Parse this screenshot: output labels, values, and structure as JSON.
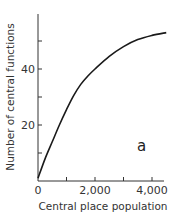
{
  "chart_data": {
    "type": "line",
    "title": "",
    "panel_label": "a",
    "xlabel": "Central place population",
    "ylabel": "Number of central functions",
    "xlim": [
      0,
      4500
    ],
    "ylim": [
      0,
      57
    ],
    "x_ticks": [
      0,
      1000,
      2000,
      3000,
      4000
    ],
    "x_tick_labels": [
      "0",
      "",
      "2,000",
      "",
      "4,000"
    ],
    "y_ticks": [
      10,
      20,
      30,
      40,
      50
    ],
    "y_tick_labels": [
      "",
      "20",
      "",
      "40",
      ""
    ],
    "grid": false,
    "legend": null,
    "series": [
      {
        "name": "curve",
        "x": [
          0,
          250,
          500,
          750,
          1000,
          1250,
          1500,
          1750,
          2000,
          2500,
          3000,
          3500,
          4000,
          4500
        ],
        "y": [
          1,
          8,
          14,
          20,
          25.5,
          30.5,
          34.5,
          37.5,
          40,
          44.5,
          48,
          50.5,
          52,
          53
        ]
      }
    ]
  }
}
